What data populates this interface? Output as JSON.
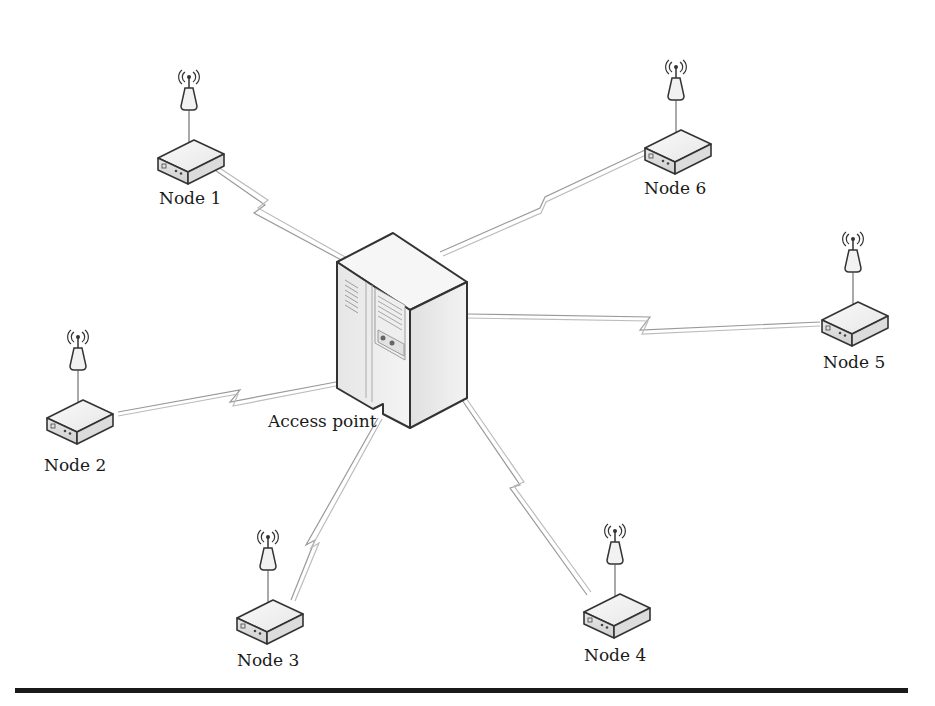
{
  "diagram": {
    "type": "star-network-topology",
    "center": {
      "label": "Access point",
      "icon": "server-tower-icon"
    },
    "nodes": [
      {
        "id": "node-1",
        "label": "Node 1",
        "icon": "wireless-router-icon"
      },
      {
        "id": "node-2",
        "label": "Node 2",
        "icon": "wireless-router-icon"
      },
      {
        "id": "node-3",
        "label": "Node 3",
        "icon": "wireless-router-icon"
      },
      {
        "id": "node-4",
        "label": "Node 4",
        "icon": "wireless-router-icon"
      },
      {
        "id": "node-5",
        "label": "Node 5",
        "icon": "wireless-router-icon"
      },
      {
        "id": "node-6",
        "label": "Node 6",
        "icon": "wireless-router-icon"
      }
    ],
    "links": [
      {
        "from": "Access point",
        "to": "Node 1",
        "style": "wireless-zigzag"
      },
      {
        "from": "Access point",
        "to": "Node 2",
        "style": "wireless-zigzag"
      },
      {
        "from": "Access point",
        "to": "Node 3",
        "style": "wireless-zigzag"
      },
      {
        "from": "Access point",
        "to": "Node 4",
        "style": "wireless-zigzag"
      },
      {
        "from": "Access point",
        "to": "Node 5",
        "style": "wireless-zigzag"
      },
      {
        "from": "Access point",
        "to": "Node 6",
        "style": "wireless-zigzag"
      }
    ],
    "colors": {
      "stroke": "#333333",
      "fill": "#f2f2f2",
      "link": "#9a9a9a",
      "rule": "#1a1a1a"
    }
  }
}
